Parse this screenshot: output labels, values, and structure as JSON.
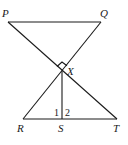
{
  "diagram": {
    "type": "geometry-figure",
    "points": {
      "P": {
        "label": "P",
        "x": 8,
        "y": 22
      },
      "Q": {
        "label": "Q",
        "x": 101,
        "y": 22
      },
      "X": {
        "label": "X",
        "x": 62,
        "y": 71
      },
      "R": {
        "label": "R",
        "x": 23,
        "y": 119
      },
      "S": {
        "label": "S",
        "x": 62,
        "y": 119
      },
      "T": {
        "label": "T",
        "x": 117,
        "y": 119
      }
    },
    "segments": [
      "PQ",
      "PT",
      "QR",
      "RT",
      "XS"
    ],
    "right_angle_at": "X",
    "angle_labels": {
      "angle1": "1",
      "angle2": "2"
    }
  }
}
